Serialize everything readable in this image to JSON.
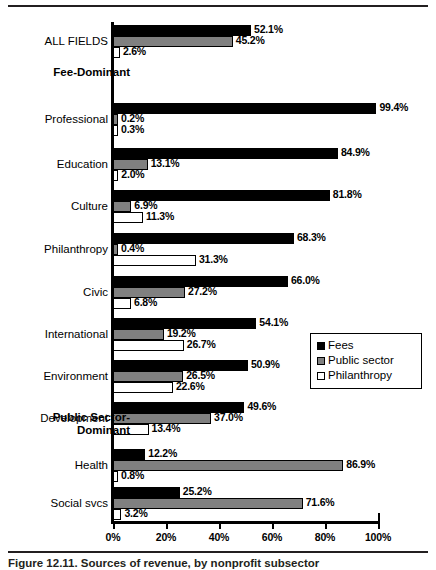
{
  "figure": {
    "caption": "Figure 12.11. Sources of revenue, by nonprofit subsector",
    "legend": {
      "position": "middle-right",
      "items": [
        {
          "label": "Fees",
          "color": "#000000",
          "key": "fees"
        },
        {
          "label": "Public sector",
          "color": "#808080",
          "key": "public_sector"
        },
        {
          "label": "Philanthropy",
          "color": "#ffffff",
          "key": "philanthropy"
        }
      ]
    }
  },
  "chart_data": {
    "type": "bar",
    "orientation": "horizontal",
    "title": "",
    "xlabel": "",
    "ylabel": "",
    "xlim": [
      0,
      100
    ],
    "xticks": [
      "0%",
      "20%",
      "40%",
      "60%",
      "80%",
      "100%"
    ],
    "xtick_values": [
      0,
      20,
      40,
      60,
      80,
      100
    ],
    "grid": false,
    "legend_position": "middle-right",
    "series": [
      {
        "name": "Fees",
        "color": "#000000"
      },
      {
        "name": "Public sector",
        "color": "#808080"
      },
      {
        "name": "Philanthropy",
        "color": "#ffffff"
      }
    ],
    "categories": [
      "ALL FIELDS",
      "Professional",
      "Education",
      "Culture",
      "Philanthropy",
      "Civic",
      "International",
      "Environment",
      "Development",
      "Health",
      "Social svcs"
    ],
    "group_headers": [
      {
        "label": "Fee-Dominant",
        "after_category": "ALL FIELDS"
      },
      {
        "label": "Public Sector-Dominant",
        "after_category": "Development"
      }
    ],
    "rows": [
      {
        "category": "ALL FIELDS",
        "fees": 52.1,
        "public_sector": 45.2,
        "philanthropy": 2.6,
        "fees_label": "52.1%",
        "public_sector_label": "45.2%",
        "philanthropy_label": "2.6%"
      },
      {
        "category": "Professional",
        "fees": 99.4,
        "public_sector": 0.2,
        "philanthropy": 0.3,
        "fees_label": "99.4%",
        "public_sector_label": "0.2%",
        "philanthropy_label": "0.3%"
      },
      {
        "category": "Education",
        "fees": 84.9,
        "public_sector": 13.1,
        "philanthropy": 2.0,
        "fees_label": "84.9%",
        "public_sector_label": "13.1%",
        "philanthropy_label": "2.0%"
      },
      {
        "category": "Culture",
        "fees": 81.8,
        "public_sector": 6.9,
        "philanthropy": 11.3,
        "fees_label": "81.8%",
        "public_sector_label": "6.9%",
        "philanthropy_label": "11.3%"
      },
      {
        "category": "Philanthropy",
        "fees": 68.3,
        "public_sector": 0.4,
        "philanthropy": 31.3,
        "fees_label": "68.3%",
        "public_sector_label": "0.4%",
        "philanthropy_label": "31.3%"
      },
      {
        "category": "Civic",
        "fees": 66.0,
        "public_sector": 27.2,
        "philanthropy": 6.8,
        "fees_label": "66.0%",
        "public_sector_label": "27.2%",
        "philanthropy_label": "6.8%"
      },
      {
        "category": "International",
        "fees": 54.1,
        "public_sector": 19.2,
        "philanthropy": 26.7,
        "fees_label": "54.1%",
        "public_sector_label": "19.2%",
        "philanthropy_label": "26.7%"
      },
      {
        "category": "Environment",
        "fees": 50.9,
        "public_sector": 26.5,
        "philanthropy": 22.6,
        "fees_label": "50.9%",
        "public_sector_label": "26.5%",
        "philanthropy_label": "22.6%"
      },
      {
        "category": "Development",
        "fees": 49.6,
        "public_sector": 37.0,
        "philanthropy": 13.4,
        "fees_label": "49.6%",
        "public_sector_label": "37.0%",
        "philanthropy_label": "13.4%"
      },
      {
        "category": "Health",
        "fees": 12.2,
        "public_sector": 86.9,
        "philanthropy": 0.8,
        "fees_label": "12.2%",
        "public_sector_label": "86.9%",
        "philanthropy_label": "0.8%"
      },
      {
        "category": "Social svcs",
        "fees": 25.2,
        "public_sector": 71.6,
        "philanthropy": 3.2,
        "fees_label": "25.2%",
        "public_sector_label": "71.6%",
        "philanthropy_label": "3.2%"
      }
    ]
  }
}
